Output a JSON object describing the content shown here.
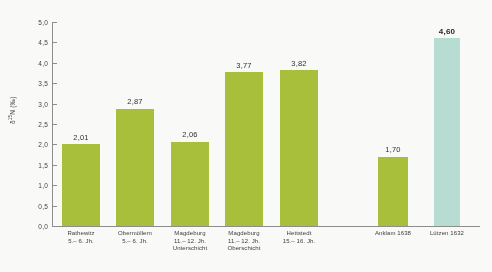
{
  "chart_data": {
    "type": "bar",
    "title": "",
    "subtitle": "",
    "xlabel": "",
    "ylabel": "δ¹⁵N (‰)",
    "ylim": [
      0.0,
      5.0
    ],
    "ytick_step": 0.5,
    "ytick_labels": [
      "0,0",
      "0,5",
      "1,0",
      "1,5",
      "2,0",
      "2,5",
      "3,0",
      "3,5",
      "4,0",
      "4,5",
      "5,0"
    ],
    "grid": false,
    "legend": null,
    "decimal_separator": ",",
    "categories": [
      "Rathewitz 5.– 6. Jh.",
      "Obermöllern 5.– 6. Jh.",
      "Magdeburg 11.– 12. Jh. Unterschicht",
      "Magdeburg 11.– 12. Jh. Oberschicht",
      "Hettstedt 15.– 16. Jh.",
      "Anklam 1638",
      "Lützen 1632"
    ],
    "values": [
      2.01,
      2.87,
      2.06,
      3.77,
      3.82,
      1.7,
      4.6
    ],
    "value_labels": [
      "2,01",
      "2,87",
      "2,06",
      "3,77",
      "3,82",
      "1,70",
      "4,60"
    ],
    "colors": [
      "#a8c22e",
      "#a8c22e",
      "#a8c22e",
      "#a8c22e",
      "#a8c22e",
      "#a8c22e",
      "#b6e0d4"
    ],
    "emphasis": [
      false,
      false,
      false,
      false,
      false,
      false,
      true
    ]
  },
  "axis": {
    "y_title_prefix": "δ",
    "y_title_sup": "15",
    "y_title_suffix": "N (‰)"
  },
  "bars": [
    {
      "name": "rathewitz",
      "value_label": "2,01",
      "line1": "Rathewitz",
      "line2": "5.– 6. Jh.",
      "line3": ""
    },
    {
      "name": "obermoellern",
      "value_label": "2,87",
      "line1": "Obermöllern",
      "line2": "5.– 6. Jh.",
      "line3": ""
    },
    {
      "name": "magdeburg-unterschicht",
      "value_label": "2,06",
      "line1": "Magdeburg",
      "line2": "11.– 12. Jh.",
      "line3": "Unterschicht"
    },
    {
      "name": "magdeburg-oberschicht",
      "value_label": "3,77",
      "line1": "Magdeburg",
      "line2": "11.– 12. Jh.",
      "line3": "Oberschicht"
    },
    {
      "name": "hettstedt",
      "value_label": "3,82",
      "line1": "Hettstedt",
      "line2": "15.– 16. Jh.",
      "line3": ""
    },
    {
      "name": "anklam-1638",
      "value_label": "1,70",
      "line1": "Anklam 1638",
      "line2": "",
      "line3": ""
    },
    {
      "name": "luetzen-1632",
      "value_label": "4,60",
      "line1": "Lützen 1632",
      "line2": "",
      "line3": ""
    }
  ]
}
